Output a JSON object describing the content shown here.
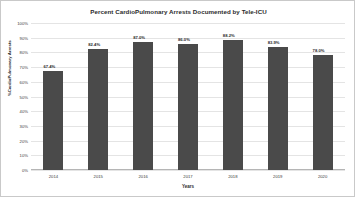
{
  "chart_data": {
    "type": "bar",
    "title": "Percent CardioPulmonary Arrests Documented by Tele-ICU",
    "xlabel": "Years",
    "ylabel": "%CardioPulmonary Arrests",
    "categories": [
      "2014",
      "2015",
      "2016",
      "2017",
      "2018",
      "2019",
      "2020"
    ],
    "values": [
      67.4,
      82.4,
      87.0,
      86.0,
      88.2,
      83.9,
      78.0
    ],
    "value_labels": [
      "67.4%",
      "82.4%",
      "87.0%",
      "86.0%",
      "88.2%",
      "83.9%",
      "78.0%"
    ],
    "ylim": [
      0,
      100
    ],
    "ytick_values": [
      100,
      90,
      80,
      70,
      60,
      50,
      40,
      30,
      20,
      10,
      0
    ],
    "ytick_labels": [
      "100%",
      "90%",
      "80%",
      "70%",
      "60%",
      "50%",
      "40%",
      "30%",
      "20%",
      "10%",
      "0%"
    ],
    "grid": true,
    "legend": "none",
    "bar_color": "#4a4a4a",
    "grid_color": "#e4e4e4",
    "background_color": "#ffffff",
    "border_color": "#c9c9c9"
  }
}
